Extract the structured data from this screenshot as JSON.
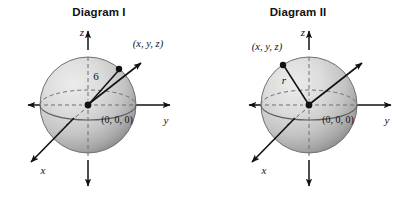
{
  "figure": {
    "type": "math-diagram",
    "panels": [
      {
        "id": "diagram-1",
        "title": "Diagram I",
        "axes": {
          "x": "x",
          "y": "y",
          "z": "z"
        },
        "origin_label": "(0, 0, 0)",
        "radius_label": "6",
        "point_label": "(x, y, z)"
      },
      {
        "id": "diagram-2",
        "title": "Diagram II",
        "axes": {
          "x": "x",
          "y": "y",
          "z": "z"
        },
        "origin_label": "(0, 0, 0)",
        "radius_label": "r",
        "point_label": "(x, y, z)"
      }
    ]
  },
  "colors": {
    "background": "#ffffff",
    "ink": "#111111",
    "sphere_light": "#e3e3e3",
    "sphere_mid": "#c9c9c9",
    "sphere_dark": "#8f8f8f",
    "sphere_outline": "#6e6e6e",
    "dashed": "#7a7a7a"
  }
}
